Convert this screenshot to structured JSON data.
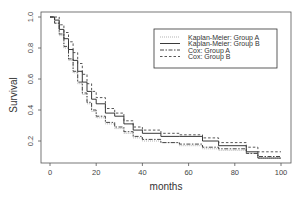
{
  "chart_data": {
    "type": "line",
    "subtype": "step-survival",
    "title": "",
    "xlabel": "months",
    "ylabel": "Survival",
    "xlim": [
      0,
      100
    ],
    "ylim": [
      0.05,
      1.0
    ],
    "xticks": [
      0,
      20,
      40,
      60,
      80,
      100
    ],
    "yticks": [
      0.2,
      0.4,
      0.6,
      0.8,
      1.0
    ],
    "xtick_labels": [
      "0",
      "20",
      "40",
      "60",
      "80",
      "100"
    ],
    "ytick_labels": [
      "0.2",
      "0.4",
      "0.6",
      "0.8",
      "1.0"
    ],
    "grid": false,
    "legend_position": "upper right (inset)",
    "series": [
      {
        "name": "Kaplan-Meier: Group A",
        "style": "dotted",
        "color": "#aaaaaa",
        "x": [
          0,
          2,
          4,
          6,
          8,
          10,
          12,
          14,
          16,
          18,
          20,
          24,
          28,
          32,
          36,
          40,
          48,
          56,
          66,
          73,
          85,
          90,
          100
        ],
        "y": [
          1.0,
          0.96,
          0.88,
          0.8,
          0.72,
          0.64,
          0.57,
          0.5,
          0.44,
          0.39,
          0.35,
          0.31,
          0.28,
          0.25,
          0.22,
          0.2,
          0.19,
          0.17,
          0.15,
          0.14,
          0.12,
          0.09,
          0.09
        ]
      },
      {
        "name": "Kaplan-Meier: Group B",
        "style": "solid",
        "color": "#222222",
        "x": [
          0,
          2,
          4,
          6,
          8,
          10,
          12,
          14,
          16,
          18,
          20,
          24,
          28,
          32,
          36,
          40,
          48,
          56,
          66,
          73,
          85,
          90,
          100
        ],
        "y": [
          1.0,
          0.98,
          0.92,
          0.86,
          0.79,
          0.72,
          0.65,
          0.58,
          0.52,
          0.47,
          0.44,
          0.38,
          0.36,
          0.31,
          0.27,
          0.25,
          0.23,
          0.23,
          0.2,
          0.17,
          0.13,
          0.09,
          0.09
        ]
      },
      {
        "name": "Cox: Group A",
        "style": "dashdot",
        "color": "#333333",
        "x": [
          0,
          2,
          4,
          6,
          8,
          10,
          12,
          14,
          16,
          18,
          20,
          24,
          28,
          32,
          36,
          40,
          48,
          56,
          66,
          73,
          85,
          90,
          100
        ],
        "y": [
          1.0,
          0.96,
          0.89,
          0.81,
          0.73,
          0.65,
          0.58,
          0.51,
          0.45,
          0.4,
          0.36,
          0.32,
          0.29,
          0.26,
          0.23,
          0.21,
          0.19,
          0.18,
          0.16,
          0.15,
          0.12,
          0.1,
          0.1
        ]
      },
      {
        "name": "Cox: Group B",
        "style": "dashed",
        "color": "#444444",
        "x": [
          0,
          2,
          4,
          6,
          8,
          10,
          12,
          14,
          16,
          18,
          20,
          24,
          28,
          32,
          36,
          40,
          48,
          56,
          66,
          73,
          85,
          90,
          100
        ],
        "y": [
          1.0,
          1.0,
          0.95,
          0.9,
          0.84,
          0.77,
          0.7,
          0.63,
          0.57,
          0.52,
          0.48,
          0.41,
          0.38,
          0.33,
          0.29,
          0.27,
          0.25,
          0.24,
          0.22,
          0.19,
          0.16,
          0.13,
          0.13
        ]
      }
    ]
  },
  "legend": {
    "items": [
      {
        "label": "Kaplan-Meier: Group A",
        "style": "dotted"
      },
      {
        "label": "Kaplan-Meier: Group B",
        "style": "solid"
      },
      {
        "label": "Cox: Group A",
        "style": "dashdot"
      },
      {
        "label": "Cox: Group B",
        "style": "dashed"
      }
    ]
  },
  "axes": {
    "xlabel": "months",
    "ylabel": "Survival",
    "xtick_labels": [
      "0",
      "20",
      "40",
      "60",
      "80",
      "100"
    ],
    "ytick_labels": [
      "0.2",
      "0.4",
      "0.6",
      "0.8",
      "1.0"
    ]
  }
}
